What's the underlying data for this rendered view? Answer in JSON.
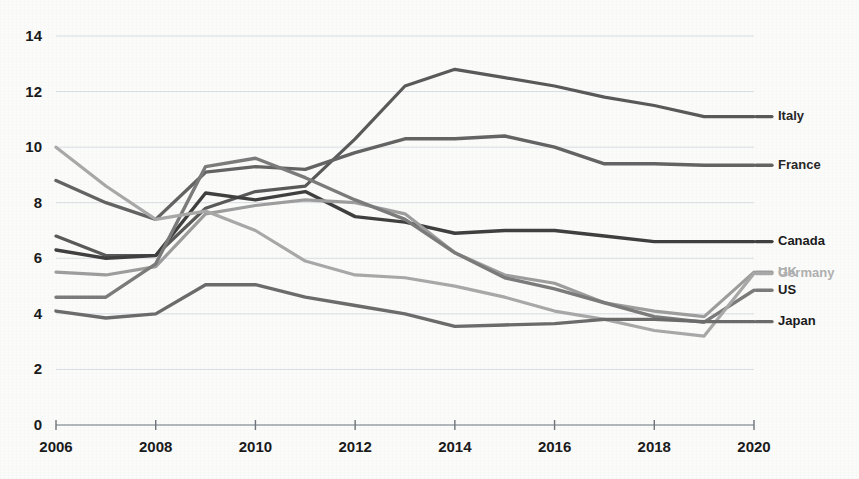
{
  "chart_data": {
    "type": "line",
    "title": "",
    "subtitle": "",
    "xlabel": "",
    "ylabel": "",
    "x": [
      2006,
      2007,
      2008,
      2009,
      2010,
      2011,
      2012,
      2013,
      2014,
      2015,
      2016,
      2017,
      2018,
      2019,
      2020
    ],
    "xlim": [
      2006,
      2020
    ],
    "ylim": [
      0,
      14
    ],
    "x_tick_labels": [
      "2006",
      "2008",
      "2010",
      "2012",
      "2014",
      "2016",
      "2018",
      "2020"
    ],
    "x_ticks": [
      2006,
      2008,
      2010,
      2012,
      2014,
      2016,
      2018,
      2020
    ],
    "y_ticks": [
      0,
      2,
      4,
      6,
      8,
      10,
      12,
      14
    ],
    "y_tick_labels": [
      "0",
      "2",
      "4",
      "6",
      "8",
      "10",
      "12",
      "14"
    ],
    "grid": "horizontal",
    "legend_position": "right-inline-end-of-line",
    "series": [
      {
        "name": "Italy",
        "color": "#595959",
        "label_color": "#262626",
        "width": 3.2,
        "label_y": 11.1,
        "values": [
          6.8,
          6.1,
          6.1,
          7.8,
          8.4,
          8.6,
          10.3,
          12.2,
          12.8,
          12.5,
          12.2,
          11.8,
          11.5,
          11.1,
          11.1
        ]
      },
      {
        "name": "France",
        "color": "#636363",
        "label_color": "#262626",
        "width": 3.4,
        "label_y": 9.35,
        "values": [
          8.8,
          8.0,
          7.4,
          9.1,
          9.3,
          9.2,
          9.8,
          10.3,
          10.3,
          10.4,
          10.0,
          9.4,
          9.4,
          9.35,
          9.35
        ]
      },
      {
        "name": "Canada",
        "color": "#3f3f3f",
        "label_color": "#1a1a1a",
        "width": 3.4,
        "label_y": 6.6,
        "values": [
          6.3,
          6.0,
          6.1,
          8.35,
          8.1,
          8.4,
          7.5,
          7.3,
          6.9,
          7.0,
          7.0,
          6.8,
          6.6,
          6.6,
          6.6
        ]
      },
      {
        "name": "UK",
        "color": "#9d9d9d",
        "label_color": "#aaaaaa",
        "width": 3.2,
        "label_y": 5.5,
        "values": [
          5.5,
          5.4,
          5.7,
          7.6,
          7.9,
          8.1,
          8.0,
          7.6,
          6.2,
          5.4,
          5.1,
          4.4,
          4.1,
          3.9,
          5.5
        ]
      },
      {
        "name": "US",
        "color": "#7b7b7b",
        "label_color": "#1a1a1a",
        "width": 3.4,
        "label_y": 4.85,
        "values": [
          4.6,
          4.6,
          5.8,
          9.3,
          9.6,
          8.9,
          8.1,
          7.4,
          6.2,
          5.3,
          4.9,
          4.4,
          3.9,
          3.7,
          4.85
        ]
      },
      {
        "name": "Germany",
        "color": "#a8a8a8",
        "label_color": "#b0b0b0",
        "width": 3.2,
        "label_y": 5.45,
        "values": [
          10.0,
          8.6,
          7.4,
          7.7,
          7.0,
          5.9,
          5.4,
          5.3,
          5.0,
          4.6,
          4.1,
          3.8,
          3.4,
          3.2,
          5.45
        ]
      },
      {
        "name": "Japan",
        "color": "#6b6b6b",
        "label_color": "#1a1a1a",
        "width": 3.4,
        "label_y": 3.72,
        "values": [
          4.1,
          3.85,
          4.0,
          5.05,
          5.05,
          4.6,
          4.3,
          4.0,
          3.55,
          3.6,
          3.65,
          3.8,
          3.8,
          3.72,
          3.72
        ]
      }
    ]
  },
  "legend": {
    "items": [
      {
        "label": "Italy"
      },
      {
        "label": "France"
      },
      {
        "label": "Canada"
      },
      {
        "label": "UK"
      },
      {
        "label": "US"
      },
      {
        "label": "Germany"
      },
      {
        "label": "Japan"
      }
    ]
  },
  "colors": {
    "background": "#fbfbfa",
    "grid": "#d8dde3",
    "axis": "#9aa0a6",
    "tick_text": "#1a1a1a"
  }
}
